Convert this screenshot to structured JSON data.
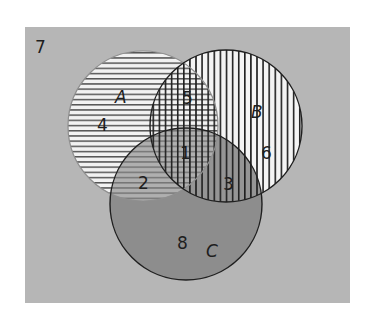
{
  "diagram": {
    "type": "venn",
    "universe": {
      "region_label": "7",
      "box": {
        "x": 25,
        "y": 27,
        "width": 325,
        "height": 276
      },
      "color": "#b6b6b6"
    },
    "sets": [
      {
        "name": "A",
        "cx": 143,
        "cy": 126,
        "r": 75,
        "pattern": "horizontal-stripes",
        "stroke": "#8f8f8f",
        "label_pos": [
          121,
          103
        ]
      },
      {
        "name": "B",
        "cx": 226,
        "cy": 126,
        "r": 76,
        "pattern": "vertical-stripes",
        "stroke": "#1f1f1f",
        "label_pos": [
          257,
          118
        ]
      },
      {
        "name": "C",
        "cx": 186,
        "cy": 204,
        "r": 76,
        "pattern": "dark-fill",
        "fill": "#878787",
        "stroke": "#1f1f1f",
        "label_pos": [
          212,
          257
        ]
      }
    ],
    "regions": [
      {
        "label": "1",
        "description": "A ∩ B ∩ C",
        "pos": [
          185,
          159
        ]
      },
      {
        "label": "2",
        "description": "A ∩ C only",
        "pos": [
          143,
          189
        ]
      },
      {
        "label": "3",
        "description": "B ∩ C only",
        "pos": [
          228,
          190
        ]
      },
      {
        "label": "4",
        "description": "A only",
        "pos": [
          103,
          131
        ]
      },
      {
        "label": "5",
        "description": "A ∩ B only",
        "pos": [
          187,
          104
        ]
      },
      {
        "label": "6",
        "description": "B only",
        "pos": [
          266,
          159
        ]
      },
      {
        "label": "7",
        "description": "outside A, B, C",
        "pos": [
          41,
          53
        ]
      },
      {
        "label": "8",
        "description": "C only",
        "pos": [
          182,
          249
        ]
      }
    ],
    "colors": {
      "background": "#ffffff",
      "universe": "#b6b6b6",
      "set_interior": "#f2f2f2",
      "c_fill": "#878787",
      "stripe": "#1f1f1f",
      "text": "#1e1e1e"
    }
  }
}
